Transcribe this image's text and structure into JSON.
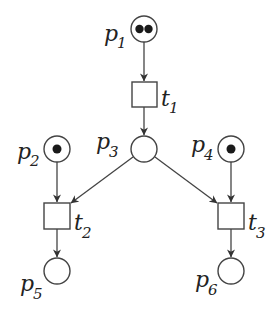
{
  "diagram": {
    "type": "petri-net",
    "colors": {
      "stroke": "#444444",
      "token": "#1a1a1a",
      "text": "#222222",
      "background": "#ffffff"
    },
    "places": [
      {
        "id": "p1",
        "label": "p",
        "sub": "1",
        "tokens": 2,
        "cx": 144,
        "cy": 29
      },
      {
        "id": "p2",
        "label": "p",
        "sub": "2",
        "tokens": 1,
        "cx": 56,
        "cy": 149
      },
      {
        "id": "p3",
        "label": "p",
        "sub": "3",
        "tokens": 0,
        "cx": 144,
        "cy": 149
      },
      {
        "id": "p4",
        "label": "p",
        "sub": "4",
        "tokens": 1,
        "cx": 231,
        "cy": 149
      },
      {
        "id": "p5",
        "label": "p",
        "sub": "5",
        "tokens": 0,
        "cx": 57,
        "cy": 271
      },
      {
        "id": "p6",
        "label": "p",
        "sub": "6",
        "tokens": 0,
        "cx": 231,
        "cy": 271
      }
    ],
    "transitions": [
      {
        "id": "t1",
        "label": "t",
        "sub": "1",
        "x": 132,
        "y": 82,
        "w": 25,
        "h": 25
      },
      {
        "id": "t2",
        "label": "t",
        "sub": "2",
        "x": 44,
        "y": 203,
        "w": 26,
        "h": 26
      },
      {
        "id": "t3",
        "label": "t",
        "sub": "3",
        "x": 218,
        "y": 203,
        "w": 26,
        "h": 26
      }
    ],
    "arcs": [
      {
        "from": "p1",
        "to": "t1"
      },
      {
        "from": "t1",
        "to": "p3"
      },
      {
        "from": "p2",
        "to": "t2"
      },
      {
        "from": "p3",
        "to": "t2"
      },
      {
        "from": "p3",
        "to": "t3"
      },
      {
        "from": "p4",
        "to": "t3"
      },
      {
        "from": "t2",
        "to": "p5"
      },
      {
        "from": "t3",
        "to": "p6"
      }
    ]
  }
}
